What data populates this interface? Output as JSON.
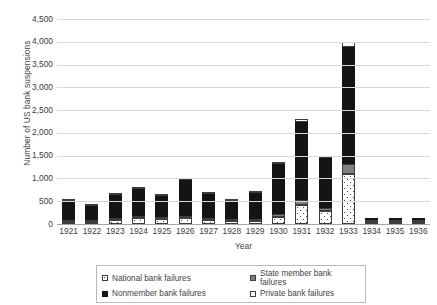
{
  "chart_data": {
    "type": "bar",
    "stacked": true,
    "title": "",
    "xlabel": "Year",
    "ylabel": "Number of US bank suspensions",
    "ylim": [
      0,
      4500
    ],
    "ytick_step": 500,
    "yticks": [
      "0",
      "500",
      "1,000",
      "1,500",
      "2,000",
      "2,500",
      "3,000",
      "3,500",
      "4,000",
      "4,500"
    ],
    "grid": true,
    "legend_position": "bottom",
    "categories": [
      "1921",
      "1922",
      "1923",
      "1924",
      "1925",
      "1926",
      "1927",
      "1928",
      "1929",
      "1930",
      "1931",
      "1932",
      "1933",
      "1934",
      "1935",
      "1936"
    ],
    "series": [
      {
        "name": "National bank failures",
        "key": "national",
        "color": "#ffffff",
        "pattern": "dotted",
        "values": [
          52,
          49,
          90,
          122,
          118,
          123,
          91,
          57,
          64,
          161,
          409,
          276,
          1101,
          9,
          6,
          8
        ]
      },
      {
        "name": "State member bank failures",
        "key": "state",
        "color": "#808080",
        "pattern": "solid",
        "values": [
          18,
          12,
          25,
          30,
          21,
          33,
          30,
          16,
          17,
          67,
          128,
          86,
          217,
          3,
          2,
          2
        ]
      },
      {
        "name": "Nonmember bank failures",
        "key": "nonmember",
        "color": "#141414",
        "pattern": "solid",
        "values": [
          414,
          308,
          500,
          595,
          450,
          795,
          521,
          413,
          570,
          1094,
          1710,
          1093,
          2571,
          49,
          23,
          50
        ]
      },
      {
        "name": "Private bank failures",
        "key": "private",
        "color": "#ffffff",
        "pattern": "open",
        "values": [
          21,
          17,
          31,
          28,
          29,
          29,
          28,
          12,
          19,
          30,
          58,
          35,
          111,
          0,
          0,
          0
        ]
      }
    ],
    "totals": [
      505,
      386,
      646,
      775,
      618,
      980,
      670,
      498,
      670,
      1352,
      2305,
      1490,
      4000,
      61,
      31,
      60
    ]
  },
  "axis": {
    "y_title": "Number of US bank suspensions",
    "x_title": "Year"
  }
}
